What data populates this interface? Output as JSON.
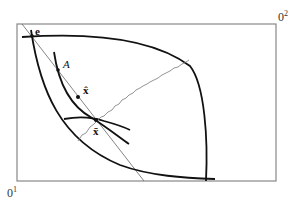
{
  "diagram": {
    "type": "edgeworth-box",
    "colors": {
      "box": "#888888",
      "curves": "#111111",
      "thin_line": "#666666",
      "contract": "#777777"
    },
    "origins": {
      "bottom_left": {
        "base": "0",
        "sup": "1"
      },
      "top_right": {
        "base": "0",
        "sup": "2"
      }
    },
    "points": {
      "endowment": "e",
      "point_a": "A",
      "x_hat": "x̂",
      "x_bar": "x̄"
    }
  }
}
